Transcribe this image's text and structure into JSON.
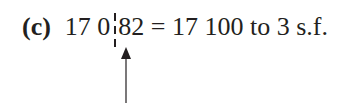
{
  "example": {
    "label": "(c)",
    "number_left": "17 0",
    "number_right": "82",
    "equation_rest": " = 17 100 to 3 s.f."
  },
  "annotation": {
    "divider": "dashed-cut-line",
    "pointer": "up-arrow-icon"
  }
}
